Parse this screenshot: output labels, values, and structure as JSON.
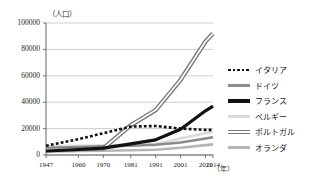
{
  "chart_data": {
    "type": "line",
    "title": "",
    "ylabel": "（人口）",
    "xlabel": "（年）",
    "ylim": [
      0,
      100000
    ],
    "xlim": [
      1947,
      2014
    ],
    "grid": true,
    "legend_position": "right",
    "ytick_labels": [
      "100000",
      "80000",
      "60000",
      "40000",
      "20000",
      "0"
    ],
    "ytick_values": [
      100000,
      80000,
      60000,
      40000,
      20000,
      0
    ],
    "xtick_labels": [
      "1947",
      "1960",
      "1970",
      "1981",
      "1991",
      "2001",
      "2011",
      "2014"
    ],
    "x": [
      1947,
      1960,
      1970,
      1981,
      1991,
      2001,
      2011,
      2014
    ],
    "series": [
      {
        "name": "イタリア",
        "style": "dotted",
        "color": "#111111",
        "values": [
          7000,
          12000,
          16500,
          21500,
          22000,
          20000,
          19000,
          19000
        ]
      },
      {
        "name": "ドイツ",
        "style": "solid-gray",
        "color": "#8c8c8c",
        "values": [
          5200,
          6000,
          6500,
          7000,
          7800,
          9500,
          12500,
          13500
        ]
      },
      {
        "name": "フランス",
        "style": "thick-black",
        "color": "#111111",
        "values": [
          3000,
          4200,
          5200,
          8500,
          11500,
          19500,
          33500,
          37000
        ]
      },
      {
        "name": "ベルギー",
        "style": "light",
        "color": "#dcdcdc",
        "values": [
          6500,
          7000,
          7200,
          7600,
          8200,
          12500,
          16500,
          17500
        ]
      },
      {
        "name": "ポルトガル",
        "style": "double",
        "color": "#777777",
        "values": [
          4000,
          4500,
          5000,
          22500,
          34000,
          57000,
          86000,
          92000
        ]
      },
      {
        "name": "オランダ",
        "style": "mid",
        "color": "#b5b5b5",
        "values": [
          2500,
          3000,
          3200,
          3600,
          4000,
          5500,
          7500,
          8000
        ]
      }
    ]
  },
  "axis": {
    "y_unit": "（人口）",
    "x_unit": "（年）"
  }
}
